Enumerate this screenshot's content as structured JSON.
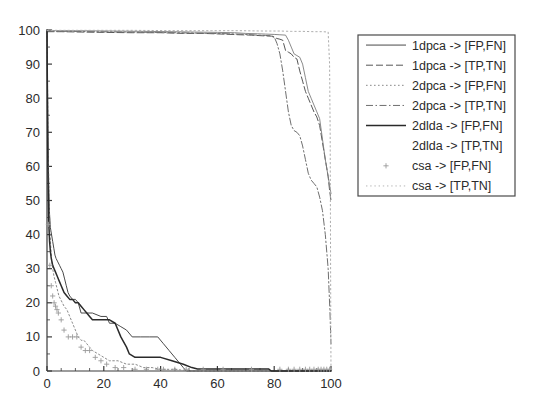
{
  "chart_data": {
    "type": "line",
    "title": "",
    "xlabel": "",
    "ylabel": "",
    "xlim": [
      0,
      100
    ],
    "ylim": [
      0,
      100
    ],
    "xticks": [
      0,
      20,
      40,
      60,
      80,
      100
    ],
    "yticks": [
      0,
      10,
      20,
      30,
      40,
      50,
      60,
      70,
      80,
      90,
      100
    ],
    "xtick_labels": [
      "0",
      "20",
      "40",
      "60",
      "80",
      "100"
    ],
    "ytick_labels": [
      "0",
      "10",
      "20",
      "30",
      "40",
      "50",
      "60",
      "70",
      "80",
      "90",
      "100"
    ],
    "xminor_tick_step": 5,
    "yminor_tick_step": 5,
    "grid": false,
    "legend_position": "right-outside-top",
    "background": "#ffffff",
    "axis_color": "#3a3a3a",
    "series": [
      {
        "name": "1dpca -> [FP,FN]",
        "style": "solid",
        "color": "#4a4a4a",
        "width": 1.0,
        "marker": "none",
        "points": [
          [
            0,
            100
          ],
          [
            0.3,
            72
          ],
          [
            0.6,
            55
          ],
          [
            0.9,
            46
          ],
          [
            1.2,
            42
          ],
          [
            1.6,
            40
          ],
          [
            2.0,
            38
          ],
          [
            2.4,
            36
          ],
          [
            2.8,
            34
          ],
          [
            3.2,
            33
          ],
          [
            3.8,
            32
          ],
          [
            4.4,
            31
          ],
          [
            5.0,
            30
          ],
          [
            5.6,
            29
          ],
          [
            6.2,
            27
          ],
          [
            6.8,
            25
          ],
          [
            7.4,
            23
          ],
          [
            8.0,
            22
          ],
          [
            9.0,
            21
          ],
          [
            10.0,
            21
          ],
          [
            11.0,
            20
          ],
          [
            12.0,
            17
          ],
          [
            13.0,
            17
          ],
          [
            16.0,
            17
          ],
          [
            19.0,
            16
          ],
          [
            21.0,
            16
          ],
          [
            22.0,
            14
          ],
          [
            24.0,
            14
          ],
          [
            26.0,
            13
          ],
          [
            28.0,
            12
          ],
          [
            30.0,
            10
          ],
          [
            33.0,
            10
          ],
          [
            36.0,
            10
          ],
          [
            39.0,
            10
          ],
          [
            41.0,
            8
          ],
          [
            43.0,
            6
          ],
          [
            45.0,
            4
          ],
          [
            47.0,
            2
          ],
          [
            48.0,
            1
          ],
          [
            49.0,
            0
          ],
          [
            100,
            0
          ]
        ]
      },
      {
        "name": "1dpca -> [TP,TN]",
        "style": "dashed",
        "color": "#565656",
        "width": 1.0,
        "marker": "none",
        "points": [
          [
            0,
            99.5
          ],
          [
            5,
            99.5
          ],
          [
            12,
            99.4
          ],
          [
            20,
            99.3
          ],
          [
            30,
            99.2
          ],
          [
            40,
            99.2
          ],
          [
            48,
            99.0
          ],
          [
            55,
            99.0
          ],
          [
            62,
            98.8
          ],
          [
            68,
            98.6
          ],
          [
            72,
            98.5
          ],
          [
            76,
            98.3
          ],
          [
            79,
            98.2
          ],
          [
            81,
            97.5
          ],
          [
            82,
            97.3
          ],
          [
            83,
            97.0
          ],
          [
            84,
            94.0
          ],
          [
            85,
            93.5
          ],
          [
            86,
            93.0
          ],
          [
            87,
            92.0
          ],
          [
            88,
            91.5
          ],
          [
            89,
            88.0
          ],
          [
            90,
            85.0
          ],
          [
            91,
            82.0
          ],
          [
            92,
            80.0
          ],
          [
            93,
            78.0
          ],
          [
            94,
            76.0
          ],
          [
            95,
            74.5
          ],
          [
            96,
            72.0
          ],
          [
            97,
            67.0
          ],
          [
            98,
            62.0
          ],
          [
            99,
            57.0
          ],
          [
            99.5,
            53.0
          ],
          [
            100,
            50.0
          ]
        ]
      },
      {
        "name": "2dpca -> [FP,FN]",
        "style": "dotted",
        "color": "#8a8a8a",
        "width": 1.0,
        "marker": "none",
        "points": [
          [
            0,
            100
          ],
          [
            0.4,
            66
          ],
          [
            0.8,
            48
          ],
          [
            1.2,
            38
          ],
          [
            1.6,
            33
          ],
          [
            2.0,
            30
          ],
          [
            2.4,
            28
          ],
          [
            3.0,
            26
          ],
          [
            3.6,
            24
          ],
          [
            4.2,
            22
          ],
          [
            4.8,
            21
          ],
          [
            5.4,
            20
          ],
          [
            6.0,
            19
          ],
          [
            7.0,
            18
          ],
          [
            8.0,
            16
          ],
          [
            9.0,
            14
          ],
          [
            10.0,
            12
          ],
          [
            11.0,
            10
          ],
          [
            12.0,
            9
          ],
          [
            13.0,
            9
          ],
          [
            14.0,
            8
          ],
          [
            15.0,
            7
          ],
          [
            16.0,
            6
          ],
          [
            18.0,
            5
          ],
          [
            20.0,
            4
          ],
          [
            22.0,
            3
          ],
          [
            25.0,
            3
          ],
          [
            28.0,
            2
          ],
          [
            31.0,
            2
          ],
          [
            34.0,
            1
          ],
          [
            37.0,
            1
          ],
          [
            40.0,
            0.5
          ],
          [
            45.0,
            0.5
          ],
          [
            50.0,
            0
          ],
          [
            100,
            0
          ]
        ]
      },
      {
        "name": "2dpca -> [TP,TN]",
        "style": "dashdot",
        "color": "#6f6f6f",
        "width": 1.0,
        "marker": "none",
        "points": [
          [
            0,
            99.6
          ],
          [
            8,
            99.6
          ],
          [
            18,
            99.5
          ],
          [
            28,
            99.4
          ],
          [
            38,
            99.3
          ],
          [
            46,
            99.2
          ],
          [
            52,
            99.1
          ],
          [
            58,
            99.0
          ],
          [
            64,
            98.9
          ],
          [
            70,
            98.7
          ],
          [
            74,
            98.5
          ],
          [
            77,
            98.4
          ],
          [
            79,
            98.3
          ],
          [
            80,
            98.0
          ],
          [
            81,
            96.0
          ],
          [
            82,
            93.0
          ],
          [
            83,
            88.0
          ],
          [
            84,
            82.0
          ],
          [
            85,
            76.0
          ],
          [
            86,
            72.0
          ],
          [
            87,
            70.5
          ],
          [
            88,
            70.0
          ],
          [
            89,
            69.0
          ],
          [
            90,
            66.0
          ],
          [
            91,
            62.0
          ],
          [
            92,
            58.0
          ],
          [
            93,
            56.0
          ],
          [
            94,
            55.0
          ],
          [
            95,
            54.0
          ],
          [
            96,
            51.0
          ],
          [
            97,
            47.0
          ],
          [
            98,
            40.0
          ],
          [
            99,
            30.0
          ],
          [
            99.6,
            18.0
          ],
          [
            100,
            8.0
          ]
        ]
      },
      {
        "name": "2dlda -> [FP,FN]",
        "style": "solid-bold",
        "color": "#2a2a2a",
        "width": 1.5,
        "marker": "none",
        "points": [
          [
            0,
            100
          ],
          [
            0.3,
            60
          ],
          [
            0.6,
            44
          ],
          [
            0.9,
            38
          ],
          [
            1.2,
            35
          ],
          [
            1.5,
            33
          ],
          [
            2.0,
            31
          ],
          [
            2.5,
            30
          ],
          [
            3.0,
            29
          ],
          [
            3.5,
            28
          ],
          [
            4.0,
            27
          ],
          [
            4.5,
            26
          ],
          [
            5.0,
            25
          ],
          [
            5.5,
            24
          ],
          [
            6.0,
            23
          ],
          [
            7.0,
            22
          ],
          [
            8.0,
            21
          ],
          [
            9.0,
            21
          ],
          [
            10.0,
            20
          ],
          [
            11.0,
            20
          ],
          [
            12.0,
            19
          ],
          [
            13.0,
            18
          ],
          [
            14.0,
            17
          ],
          [
            15.0,
            16
          ],
          [
            16.0,
            15
          ],
          [
            18.0,
            15
          ],
          [
            20.0,
            15
          ],
          [
            22.0,
            15
          ],
          [
            24.0,
            14
          ],
          [
            26.0,
            10
          ],
          [
            28.0,
            7
          ],
          [
            29.0,
            5
          ],
          [
            31.0,
            4
          ],
          [
            35.0,
            4
          ],
          [
            40.0,
            4
          ],
          [
            44.0,
            3
          ],
          [
            48.0,
            2
          ],
          [
            51.0,
            1
          ],
          [
            53.0,
            0.6
          ],
          [
            57.0,
            0.6
          ],
          [
            62.0,
            0.6
          ],
          [
            68.0,
            0.6
          ],
          [
            74.0,
            0.6
          ],
          [
            78.0,
            0.6
          ],
          [
            79.0,
            0
          ],
          [
            100,
            0
          ]
        ]
      },
      {
        "name": "2dlda -> [TP,TN]",
        "style": "solid-thin",
        "color": "#7d7d7d",
        "width": 0.9,
        "marker": "none",
        "points": [
          [
            0,
            99.8
          ],
          [
            10,
            99.8
          ],
          [
            22,
            99.7
          ],
          [
            34,
            99.6
          ],
          [
            44,
            99.5
          ],
          [
            52,
            99.4
          ],
          [
            60,
            99.3
          ],
          [
            66,
            99.2
          ],
          [
            70,
            99.0
          ],
          [
            74,
            98.9
          ],
          [
            77,
            98.8
          ],
          [
            80,
            98.7
          ],
          [
            82,
            98.6
          ],
          [
            84,
            98.5
          ],
          [
            85,
            97.0
          ],
          [
            86,
            95.0
          ],
          [
            87,
            93.0
          ],
          [
            88,
            92.5
          ],
          [
            89,
            92.0
          ],
          [
            90,
            90.0
          ],
          [
            91,
            86.0
          ],
          [
            92,
            82.0
          ],
          [
            93,
            80.0
          ],
          [
            94,
            78.0
          ],
          [
            95,
            76.0
          ],
          [
            96,
            74.0
          ],
          [
            97,
            68.0
          ],
          [
            98,
            62.0
          ],
          [
            99,
            57.0
          ],
          [
            100,
            52.0
          ]
        ]
      },
      {
        "name": "csa -> [FP,FN]",
        "style": "marker-only",
        "color": "#9a9a9a",
        "width": 0,
        "marker": "plus",
        "points": [
          [
            0.5,
            43
          ],
          [
            1.0,
            31
          ],
          [
            1.5,
            25
          ],
          [
            2.0,
            22
          ],
          [
            2.5,
            20
          ],
          [
            3.0,
            19
          ],
          [
            3.5,
            18
          ],
          [
            4.0,
            17
          ],
          [
            5.0,
            15
          ],
          [
            6.0,
            12
          ],
          [
            7.5,
            10
          ],
          [
            9.0,
            10
          ],
          [
            10.5,
            10
          ],
          [
            12.0,
            7
          ],
          [
            13.5,
            6
          ],
          [
            15.0,
            6
          ],
          [
            17.0,
            4
          ],
          [
            19.0,
            3
          ],
          [
            21.0,
            2
          ],
          [
            24.0,
            1
          ],
          [
            27.0,
            1
          ],
          [
            31.0,
            0.5
          ],
          [
            35.0,
            0.5
          ],
          [
            39.0,
            0.5
          ],
          [
            41.0,
            0.5
          ],
          [
            45.0,
            0.5
          ],
          [
            49.0,
            0.5
          ],
          [
            55.0,
            0.5
          ],
          [
            62.0,
            0.5
          ],
          [
            72.0,
            0.5
          ],
          [
            82.0,
            0.5
          ],
          [
            85.0,
            0.5
          ],
          [
            87.0,
            0.5
          ],
          [
            89.0,
            0.5
          ],
          [
            91.0,
            0.5
          ],
          [
            92.5,
            0.5
          ],
          [
            94.0,
            0.5
          ],
          [
            95.5,
            0.5
          ],
          [
            96.5,
            0.5
          ],
          [
            97.5,
            0.5
          ],
          [
            98.5,
            0.5
          ],
          [
            99.5,
            0.5
          ]
        ]
      },
      {
        "name": "csa -> [TP,TN]",
        "style": "dotted-light",
        "color": "#aeaeae",
        "width": 1.0,
        "marker": "none",
        "points": [
          [
            0,
            99.9
          ],
          [
            15,
            99.9
          ],
          [
            30,
            99.9
          ],
          [
            45,
            99.8
          ],
          [
            58,
            99.8
          ],
          [
            68,
            99.8
          ],
          [
            76,
            99.7
          ],
          [
            82,
            99.7
          ],
          [
            86,
            99.6
          ],
          [
            90,
            99.6
          ],
          [
            94,
            99.5
          ],
          [
            97,
            99.5
          ],
          [
            99,
            99.4
          ],
          [
            99.5,
            90.0
          ],
          [
            99.7,
            70.0
          ],
          [
            99.8,
            45.0
          ],
          [
            99.9,
            20.0
          ],
          [
            100,
            0
          ]
        ]
      }
    ],
    "legend_entries": [
      {
        "label": "1dpca -> [FP,FN]",
        "style": "solid",
        "color": "#4a4a4a"
      },
      {
        "label": "1dpca -> [TP,TN]",
        "style": "dashed",
        "color": "#565656"
      },
      {
        "label": "2dpca -> [FP,FN]",
        "style": "dotted",
        "color": "#8a8a8a"
      },
      {
        "label": "2dpca -> [TP,TN]",
        "style": "dashdot",
        "color": "#6f6f6f"
      },
      {
        "label": "2dlda -> [FP,FN]",
        "style": "solid-bold",
        "color": "#2a2a2a"
      },
      {
        "label": "2dlda -> [TP,TN]",
        "style": "solid-thin",
        "color": "#7d7d7d"
      },
      {
        "label": "csa -> [FP,FN]",
        "style": "marker-only",
        "color": "#9a9a9a"
      },
      {
        "label": "csa -> [TP,TN]",
        "style": "dotted-light",
        "color": "#aeaeae"
      }
    ]
  }
}
